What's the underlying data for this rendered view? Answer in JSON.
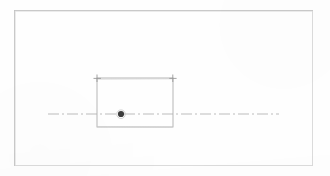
{
  "drawing": {
    "title": "Technical line drawing",
    "description": "Faint scanned CAD-style engineering sketch: a rectangular outline with corner tick marks, a horizontal dash-dot centerline running through it, and a solid center point marker.",
    "background_color": "#fefefe",
    "ink_color": "#b9b9b9",
    "ink_color_dark": "#8f8f8f",
    "marker_color": "#4a4a4a",
    "canvas": {
      "width": 330,
      "height": 176
    },
    "border_frame": {
      "label": "sheet border",
      "x": 14.5,
      "y": 10.5,
      "width": 298,
      "height": 155,
      "stroke": "#c4c4c4",
      "stroke_width": 0.9
    },
    "rectangle": {
      "label": "part outline",
      "x": 97,
      "y": 78,
      "width": 76,
      "height": 49,
      "stroke": "#b0b0b0",
      "stroke_width": 0.9
    },
    "corner_ticks": [
      {
        "label": "top-left corner tick",
        "cx": 97,
        "cy": 78,
        "size": 5
      },
      {
        "label": "top-right corner tick",
        "cx": 173,
        "cy": 78,
        "size": 5
      }
    ],
    "centerline": {
      "label": "horizontal dash-dot centerline",
      "x1": 48,
      "x2": 279,
      "y": 114,
      "stroke": "#b5b5b5",
      "stroke_width": 0.9,
      "dash_pattern": "11 3 2 3"
    },
    "center_point": {
      "label": "center point marker",
      "cx": 121,
      "cy": 114,
      "radius": 3.1,
      "fill": "#3d3d3d"
    }
  }
}
